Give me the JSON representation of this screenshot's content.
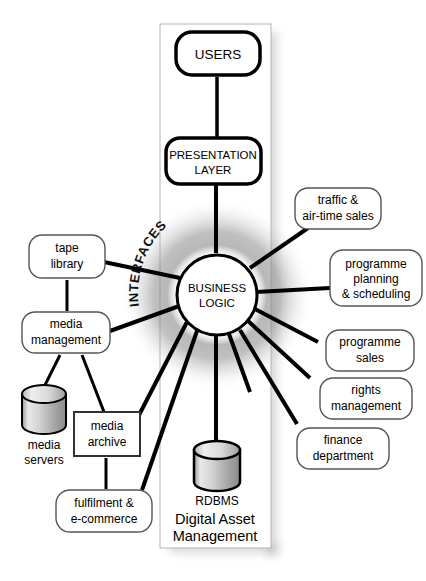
{
  "diagram": {
    "title": "Digital Asset Management",
    "panel_label": "Digital Asset Management",
    "arc_label": "INTERFACES",
    "colors": {
      "stroke": "#000000",
      "fill": "#ffffff",
      "glow": "#9a9a9a",
      "panel_fill": "#ffffff",
      "panel_stroke": "#b0b0b0",
      "shadow": "#bdbdbd",
      "cylinder_light": "#f2f2f2",
      "cylinder_dark": "#8e8e8e"
    },
    "core": {
      "label_line1": "BUSINESS",
      "label_line2": "LOGIC"
    },
    "stack": [
      {
        "id": "users",
        "label_line1": "USERS",
        "label_line2": ""
      },
      {
        "id": "presentation-layer",
        "label_line1": "PRESENTATION",
        "label_line2": "LAYER"
      }
    ],
    "database": {
      "id": "rdbms",
      "label": "RDBMS"
    },
    "left_nodes": [
      {
        "id": "tape-library",
        "label_line1": "tape",
        "label_line2": "library"
      },
      {
        "id": "media-management",
        "label_line1": "media",
        "label_line2": "management"
      },
      {
        "id": "media-archive",
        "label_line1": "media",
        "label_line2": "archive"
      },
      {
        "id": "media-servers",
        "label_line1": "media",
        "label_line2": "servers"
      },
      {
        "id": "fulfilment-e-commerce",
        "label_line1": "fulfilment &",
        "label_line2": "e-commerce"
      }
    ],
    "right_nodes": [
      {
        "id": "traffic-air-time-sales",
        "label_line1": "traffic &",
        "label_line2": "air-time sales",
        "label_line3": ""
      },
      {
        "id": "programme-planning-scheduling",
        "label_line1": "programme",
        "label_line2": "planning",
        "label_line3": "& scheduling"
      },
      {
        "id": "programme-sales",
        "label_line1": "programme",
        "label_line2": "sales",
        "label_line3": ""
      },
      {
        "id": "rights-management",
        "label_line1": "rights",
        "label_line2": "management",
        "label_line3": ""
      },
      {
        "id": "finance-department",
        "label_line1": "finance",
        "label_line2": "department",
        "label_line3": ""
      }
    ]
  }
}
